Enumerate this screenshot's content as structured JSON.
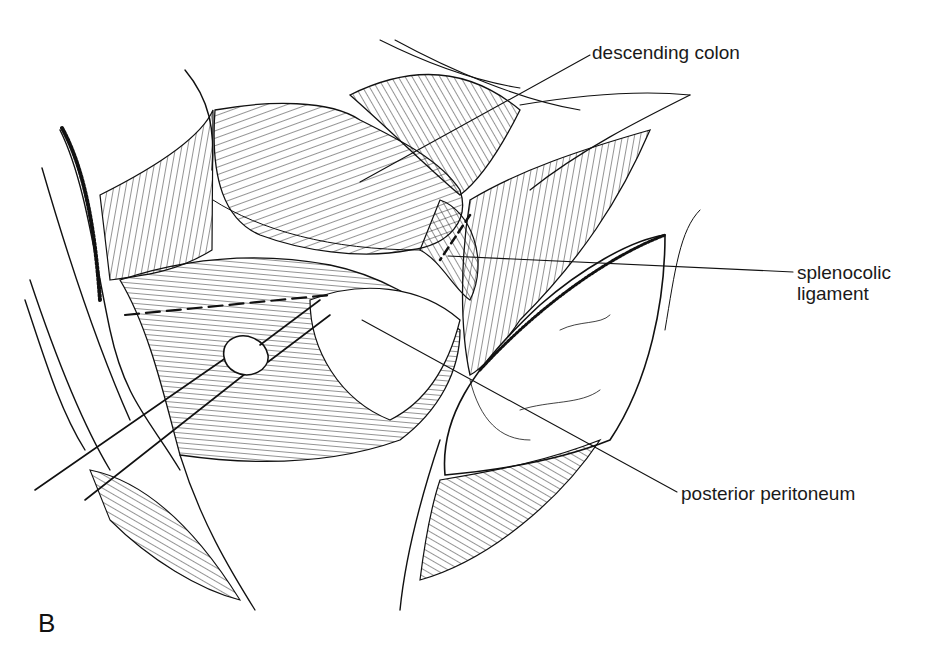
{
  "figure": {
    "panel_letter": "B",
    "type": "anatomical line illustration",
    "ink_color": "#111111",
    "background_color": "#ffffff"
  },
  "labels": [
    {
      "id": "descending-colon",
      "text": "descending colon",
      "x": 592,
      "y": 42,
      "pointer_to": [
        360,
        182
      ]
    },
    {
      "id": "splenocolic-ligament",
      "line1": "splenocolic",
      "line2": "ligament",
      "x": 797,
      "y": 262,
      "pointer_to": [
        448,
        256
      ]
    },
    {
      "id": "posterior-peritoneum",
      "text": "posterior peritoneum",
      "x": 681,
      "y": 483,
      "pointer_to": [
        362,
        320
      ]
    }
  ]
}
